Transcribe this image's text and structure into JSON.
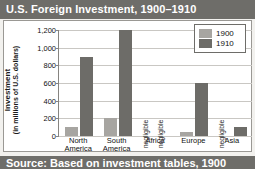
{
  "title": "U.S. Foreign Investment, 1900–1910",
  "source_strip_text": "Source: Based on investment tables, 1900",
  "legend": {
    "position": "top-right",
    "entries": [
      {
        "label": "1900",
        "color": "#a7a5a1"
      },
      {
        "label": "1910",
        "color": "#6d6c68"
      }
    ]
  },
  "axis": {
    "y_title_line1": "Investment",
    "y_title_line2": "(in millions of U.S. dollars)",
    "y_ticks": [
      "1,200",
      "1,000",
      "800",
      "600",
      "400",
      "200",
      "0"
    ]
  },
  "chart_data": {
    "type": "bar",
    "title": "U.S. Foreign Investment, 1900–1910",
    "xlabel": "",
    "ylabel": "Investment (in millions of U.S. dollars)",
    "ylim": [
      0,
      1200
    ],
    "ytick_values": [
      0,
      200,
      400,
      600,
      800,
      1000,
      1200
    ],
    "grid": true,
    "legend_position": "top-right",
    "categories": [
      "North America",
      "South America",
      "Africa",
      "Europe",
      "Asia"
    ],
    "series": [
      {
        "name": "1900",
        "color": "#a7a5a1",
        "values": [
          100,
          200,
          0,
          50,
          0
        ],
        "labels": [
          "",
          "",
          "negligible",
          "",
          "negligible"
        ]
      },
      {
        "name": "1910",
        "color": "#6d6c68",
        "values": [
          900,
          1200,
          0,
          600,
          100
        ],
        "labels": [
          "",
          "",
          "negligible",
          "",
          ""
        ]
      }
    ]
  },
  "bars": [
    {
      "category": "North America",
      "line1": "North",
      "line2": "America",
      "b1900": {
        "value": 100,
        "negligible": false,
        "note": ""
      },
      "b1910": {
        "value": 900,
        "negligible": false,
        "note": ""
      }
    },
    {
      "category": "South America",
      "line1": "South",
      "line2": "America",
      "b1900": {
        "value": 200,
        "negligible": false,
        "note": ""
      },
      "b1910": {
        "value": 1200,
        "negligible": false,
        "note": ""
      }
    },
    {
      "category": "Africa",
      "line1": "Africa",
      "line2": "",
      "b1900": {
        "value": 0,
        "negligible": true,
        "note": "negligible"
      },
      "b1910": {
        "value": 0,
        "negligible": true,
        "note": "negligible"
      }
    },
    {
      "category": "Europe",
      "line1": "Europe",
      "line2": "",
      "b1900": {
        "value": 50,
        "negligible": false,
        "note": ""
      },
      "b1910": {
        "value": 600,
        "negligible": false,
        "note": ""
      }
    },
    {
      "category": "Asia",
      "line1": "Asia",
      "line2": "",
      "b1900": {
        "value": 0,
        "negligible": true,
        "note": "negligible"
      },
      "b1910": {
        "value": 100,
        "negligible": false,
        "note": ""
      }
    }
  ]
}
